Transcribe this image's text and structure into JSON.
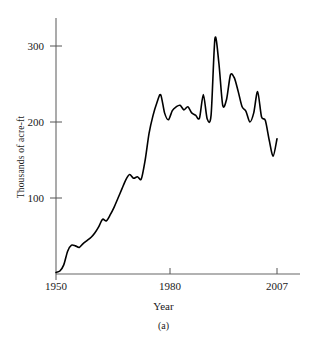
{
  "chart_data": {
    "type": "line",
    "title": "",
    "subcaption": "(a)",
    "xlabel": "Year",
    "ylabel": "Thousands of acre-ft",
    "xlim": [
      1950,
      2007
    ],
    "ylim": [
      0,
      340
    ],
    "xticks": [
      1950,
      1980,
      2007
    ],
    "xtick_labels": [
      "1950",
      "1980",
      "2007"
    ],
    "yticks": [
      100,
      200,
      300
    ],
    "ytick_labels": [
      "100",
      "200",
      "300"
    ],
    "grid": false,
    "legend": null,
    "line_color": "#000000",
    "series": [
      {
        "name": "Water use",
        "x": [
          1950,
          1951,
          1952,
          1953,
          1954,
          1955,
          1956,
          1957,
          1958,
          1959,
          1960,
          1961,
          1962,
          1963,
          1964,
          1965,
          1966,
          1967,
          1968,
          1969,
          1970,
          1971,
          1972,
          1973,
          1974,
          1975,
          1976,
          1977,
          1978,
          1979,
          1980,
          1981,
          1982,
          1983,
          1984,
          1985,
          1986,
          1987,
          1988,
          1989,
          1990,
          1991,
          1992,
          1993,
          1994,
          1995,
          1996,
          1997,
          1998,
          1999,
          2000,
          2001,
          2002,
          2003,
          2004,
          2005,
          2006,
          2007
        ],
        "values": [
          2,
          4,
          12,
          30,
          38,
          37,
          35,
          40,
          44,
          48,
          54,
          62,
          72,
          70,
          78,
          88,
          100,
          112,
          124,
          131,
          126,
          128,
          125,
          150,
          185,
          208,
          225,
          236,
          212,
          203,
          215,
          220,
          222,
          216,
          220,
          212,
          209,
          205,
          236,
          204,
          209,
          310,
          278,
          222,
          230,
          262,
          258,
          240,
          220,
          214,
          200,
          212,
          240,
          207,
          202,
          176,
          155,
          178
        ],
        "units": "thousands of acre-ft"
      }
    ],
    "annotations": {
      "peak_value": 310,
      "peak_year": 1991,
      "start_value": 2,
      "start_year": 1950,
      "end_value": 178,
      "end_year": 2007
    }
  },
  "axes": {
    "y_title": "Thousands of acre-ft",
    "x_title": "Year",
    "y_labels": [
      "300",
      "200",
      "100"
    ],
    "x_labels": [
      "1950",
      "1980",
      "2007"
    ]
  },
  "caption": {
    "label": "(a)"
  },
  "colors": {
    "line": "#000000",
    "axis": "#555555",
    "background": "#ffffff",
    "text": "#1a1a1a"
  }
}
